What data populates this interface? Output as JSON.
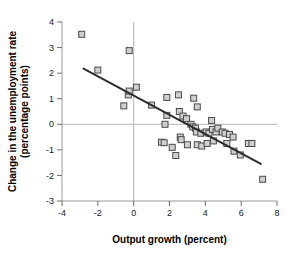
{
  "chart_data": {
    "type": "scatter",
    "title": "",
    "xlabel": "Output growth (percent)",
    "ylabel": "Change in the unemployment rate (percentage points)",
    "ylabel_line1": "Change in the unemployment rate",
    "ylabel_line2": "(percentage points)",
    "xlim": [
      -4,
      8
    ],
    "ylim": [
      -3,
      4
    ],
    "xticks": [
      -4,
      -2,
      0,
      2,
      4,
      6,
      8
    ],
    "xtick_labels": [
      "-4",
      "-2",
      "0",
      "2",
      "4",
      "6",
      "8"
    ],
    "yticks": [
      -3,
      -2,
      -1,
      0,
      1,
      2,
      3,
      4
    ],
    "ytick_labels": [
      "-3",
      "-2",
      "-1",
      "0",
      "1",
      "2",
      "3",
      "4"
    ],
    "grid": false,
    "zero_lines": {
      "horizontal_y": 0,
      "vertical_x": 0
    },
    "legend": null,
    "marker_style": "open-square",
    "colors": {
      "marker_fill": "#cfcfcf",
      "marker_edge": "#4a4a4a",
      "trendline": "#2b2b2b",
      "axis": "#9a9a9a",
      "zero_line": "#b4b4b4",
      "text": "#000000",
      "background": "#ffffff"
    },
    "points": [
      {
        "x": -2.9,
        "y": 3.52
      },
      {
        "x": -2.0,
        "y": 2.12
      },
      {
        "x": -0.25,
        "y": 2.88
      },
      {
        "x": -0.3,
        "y": 1.15
      },
      {
        "x": -0.25,
        "y": 1.3
      },
      {
        "x": 0.15,
        "y": 1.45
      },
      {
        "x": -0.55,
        "y": 0.72
      },
      {
        "x": 1.0,
        "y": 0.75
      },
      {
        "x": 1.85,
        "y": 1.05
      },
      {
        "x": 2.5,
        "y": 1.15
      },
      {
        "x": 3.35,
        "y": 1.02
      },
      {
        "x": 3.55,
        "y": 0.68
      },
      {
        "x": 1.85,
        "y": 0.35
      },
      {
        "x": 2.55,
        "y": 0.5
      },
      {
        "x": 2.75,
        "y": 0.32
      },
      {
        "x": 2.95,
        "y": 0.22
      },
      {
        "x": 1.75,
        "y": 0.0
      },
      {
        "x": 3.2,
        "y": 0.0
      },
      {
        "x": 3.3,
        "y": -0.1
      },
      {
        "x": 3.45,
        "y": -0.15
      },
      {
        "x": 3.5,
        "y": -0.3
      },
      {
        "x": 3.75,
        "y": -0.35
      },
      {
        "x": 4.05,
        "y": -0.3
      },
      {
        "x": 4.2,
        "y": -0.35
      },
      {
        "x": 4.35,
        "y": 0.15
      },
      {
        "x": 4.4,
        "y": -0.2
      },
      {
        "x": 4.6,
        "y": -0.3
      },
      {
        "x": 4.7,
        "y": -0.15
      },
      {
        "x": 4.95,
        "y": -0.3
      },
      {
        "x": 5.1,
        "y": -0.35
      },
      {
        "x": 5.35,
        "y": -0.4
      },
      {
        "x": 5.55,
        "y": -0.5
      },
      {
        "x": 2.6,
        "y": -0.5
      },
      {
        "x": 2.65,
        "y": -0.6
      },
      {
        "x": 1.55,
        "y": -0.7
      },
      {
        "x": 1.7,
        "y": -0.72
      },
      {
        "x": 2.15,
        "y": -0.9
      },
      {
        "x": 2.35,
        "y": -1.22
      },
      {
        "x": 3.0,
        "y": -0.8
      },
      {
        "x": 3.55,
        "y": -0.8
      },
      {
        "x": 3.8,
        "y": -0.85
      },
      {
        "x": 4.1,
        "y": -0.75
      },
      {
        "x": 4.45,
        "y": -0.65
      },
      {
        "x": 5.2,
        "y": -0.75
      },
      {
        "x": 5.6,
        "y": -1.05
      },
      {
        "x": 5.95,
        "y": -1.2
      },
      {
        "x": 6.4,
        "y": -0.75
      },
      {
        "x": 6.6,
        "y": -0.75
      },
      {
        "x": 7.2,
        "y": -2.15
      }
    ],
    "trendline": {
      "x_start": -2.8,
      "y_start": 2.18,
      "x_end": 7.1,
      "y_end": -1.55,
      "slope": -0.377,
      "intercept": 1.12
    }
  }
}
